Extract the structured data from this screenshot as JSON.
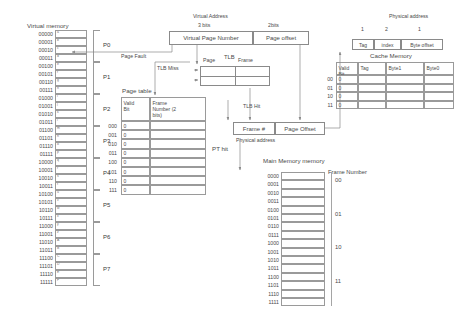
{
  "titles": {
    "virtual_memory": "Virtual memory",
    "virtual_address": "Virtual Address",
    "physical_address_top": "Physical address",
    "cache_memory": "Cache Memory",
    "page_table": "Page table",
    "main_memory": "Main Memory memory",
    "frame_number_col": "Frame Number",
    "tlb": "TLB"
  },
  "virtual_address": {
    "bits_left": "3 bits",
    "bits_right": "2bits",
    "field_left": "Virtual Page Number",
    "field_right": "Page offset"
  },
  "physical_address_bits": [
    "1",
    "2",
    "1"
  ],
  "cache_fields": [
    "Tag",
    "index",
    "Byte offset"
  ],
  "cache_table": {
    "headers": [
      "Valid Bit",
      "Tag",
      "Byte1",
      "Byte0"
    ],
    "row_labels": [
      "00",
      "01",
      "10",
      "11"
    ],
    "valid_values": [
      "0",
      "0",
      "0",
      "0"
    ]
  },
  "tlb": {
    "col_left": "Page",
    "col_right": "Frame",
    "rows": 2
  },
  "page_table": {
    "headers": [
      "Valid Bit",
      "Frame Number (2 bits)"
    ],
    "row_labels": [
      "000",
      "001",
      "010",
      "011",
      "100",
      "101",
      "110",
      "111"
    ],
    "valid_values": [
      "0",
      "0",
      "0",
      "0",
      "0",
      "0",
      "0",
      "0"
    ]
  },
  "physical_address_split": {
    "left": "Frame #",
    "right": "Page Offset",
    "caption": "Physical address"
  },
  "arrow_labels": {
    "page_fault": "Page Fault",
    "tlb_miss": "TLB Miss",
    "tlb_hit": "TLB Hit",
    "pt_hit": "PT hit"
  },
  "virtual_memory": {
    "addresses": [
      "00000",
      "00001",
      "00010",
      "00011",
      "00100",
      "00101",
      "00110",
      "00111",
      "01000",
      "01001",
      "01010",
      "01011",
      "01100",
      "01101",
      "01110",
      "01111",
      "10000",
      "10001",
      "10010",
      "10011",
      "10100",
      "10101",
      "10110",
      "10111",
      "11000",
      "11001",
      "11010",
      "11011",
      "11100",
      "11101",
      "11110",
      "11111"
    ],
    "contents": [
      "a",
      "b",
      "c",
      "d",
      "e",
      "f",
      "g",
      "h",
      "i",
      "j",
      "k",
      "l",
      "m",
      "n",
      "o",
      "p",
      "q",
      "r",
      "s",
      "t",
      "u",
      "v",
      "w",
      "x",
      "y",
      "z",
      "A",
      "B",
      "C",
      "D",
      "E",
      "F"
    ],
    "pages": [
      "P0",
      "P1",
      "P2",
      "P3",
      "P4",
      "P5",
      "P6",
      "P7"
    ]
  },
  "main_memory": {
    "addresses": [
      "0000",
      "0001",
      "0010",
      "0011",
      "0100",
      "0101",
      "0110",
      "0111",
      "1000",
      "1001",
      "1010",
      "1011",
      "1100",
      "1101",
      "1110",
      "1111"
    ],
    "frames": [
      "00",
      "01",
      "10",
      "11"
    ]
  }
}
